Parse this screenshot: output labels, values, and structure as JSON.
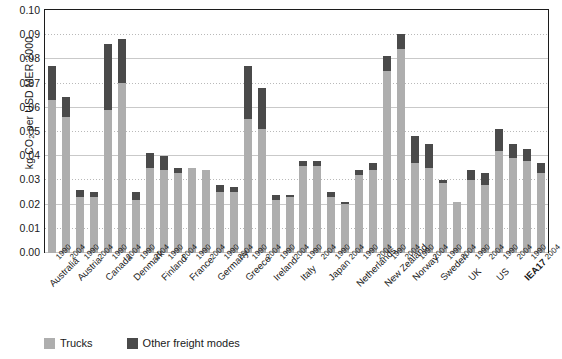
{
  "chart_data": {
    "type": "bar",
    "stacked": true,
    "title": "",
    "xlabel": "",
    "ylabel": "kg CO2 per USD MER 2000",
    "ylabel_parts": {
      "pre": "kg CO",
      "sub": "2",
      "post": " per USD MER 2000"
    },
    "ylim": [
      0.0,
      0.1
    ],
    "ytick_step": 0.01,
    "ytick_labels": [
      "0.10",
      "0.09",
      "0.08",
      "0.07",
      "0.06",
      "0.05",
      "0.04",
      "0.03",
      "0.02",
      "0.01",
      "0.00"
    ],
    "grid": true,
    "legend_position": "bottom-left",
    "legend": [
      "Trucks",
      "Other freight modes"
    ],
    "colors": {
      "trucks": "#aeaeae",
      "other": "#4a4a4a",
      "axis": "#1c1c1c",
      "grid": "#b9b9b9"
    },
    "categories": [
      "Australia 1990",
      "Australia 2004",
      "Austria 1990",
      "Austria 2004",
      "Canada 1990",
      "Canada 2004",
      "Denmark 1990",
      "Denmark 2004",
      "Finland 1990",
      "Finland 2004",
      "France 1990",
      "France 2004",
      "Germany 1990",
      "Germany 2004",
      "Greece 1990",
      "Greece 2004",
      "Ireland 1990",
      "Ireland 2004",
      "Italy 1990",
      "Italy 2004",
      "Japan 1990",
      "Japan 2004",
      "Netherlands 1990",
      "Netherlands 2004",
      "New Zealand 1990",
      "New Zealand 2004",
      "Norway 1990",
      "Norway 2004",
      "Sweden 1990",
      "Sweden 2004",
      "UK 1990",
      "UK 2004",
      "US 1990",
      "US 2004",
      "IEA17 1990",
      "IEA17 2004"
    ],
    "countries": [
      {
        "name": "Australia",
        "bold": false
      },
      {
        "name": "Austria",
        "bold": false
      },
      {
        "name": "Canada",
        "bold": false
      },
      {
        "name": "Denmark",
        "bold": false
      },
      {
        "name": "Finland",
        "bold": false
      },
      {
        "name": "France",
        "bold": false
      },
      {
        "name": "Germany",
        "bold": false
      },
      {
        "name": "Greece",
        "bold": false
      },
      {
        "name": "Ireland",
        "bold": false
      },
      {
        "name": "Italy",
        "bold": false
      },
      {
        "name": "Japan",
        "bold": false
      },
      {
        "name": "Netherlands",
        "bold": false
      },
      {
        "name": "New Zealand",
        "bold": false
      },
      {
        "name": "Norway",
        "bold": false
      },
      {
        "name": "Sweden",
        "bold": false
      },
      {
        "name": "UK",
        "bold": false
      },
      {
        "name": "US",
        "bold": false
      },
      {
        "name": "IEA17",
        "bold": true
      }
    ],
    "years": [
      "1990",
      "2004"
    ],
    "series": [
      {
        "name": "Trucks",
        "color": "#aeaeae",
        "values": [
          0.063,
          0.056,
          0.023,
          0.023,
          0.059,
          0.07,
          0.022,
          0.035,
          0.034,
          0.033,
          0.035,
          0.034,
          0.025,
          0.025,
          0.055,
          0.051,
          0.022,
          0.023,
          0.036,
          0.036,
          0.023,
          0.02,
          0.032,
          0.034,
          0.075,
          0.084,
          0.037,
          0.035,
          0.029,
          0.021,
          0.03,
          0.028,
          0.042,
          0.039,
          0.038,
          0.033
        ]
      },
      {
        "name": "Other freight modes",
        "color": "#4a4a4a",
        "values": [
          0.014,
          0.008,
          0.003,
          0.002,
          0.027,
          0.018,
          0.003,
          0.006,
          0.006,
          0.002,
          0.0,
          0.0,
          0.003,
          0.002,
          0.022,
          0.017,
          0.002,
          0.001,
          0.002,
          0.002,
          0.002,
          0.001,
          0.002,
          0.003,
          0.006,
          0.006,
          0.011,
          0.01,
          0.001,
          0.0,
          0.004,
          0.005,
          0.009,
          0.006,
          0.005,
          0.004
        ]
      }
    ],
    "totals": [
      0.077,
      0.064,
      0.026,
      0.025,
      0.086,
      0.088,
      0.025,
      0.041,
      0.04,
      0.035,
      0.035,
      0.034,
      0.028,
      0.027,
      0.077,
      0.068,
      0.024,
      0.024,
      0.038,
      0.038,
      0.025,
      0.021,
      0.034,
      0.037,
      0.081,
      0.09,
      0.048,
      0.045,
      0.03,
      0.021,
      0.034,
      0.033,
      0.051,
      0.045,
      0.043,
      0.037
    ]
  }
}
